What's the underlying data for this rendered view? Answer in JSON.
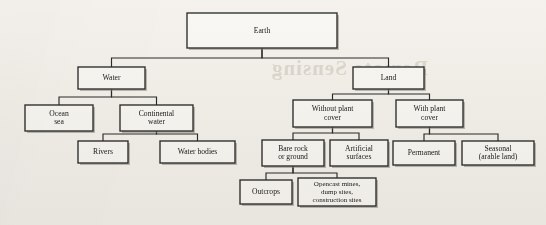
{
  "figure": {
    "background_color": "#f6f4f0",
    "line_color": "#2b2b2b",
    "box_fill": "#fbfaf7",
    "bleed_through_text": "Remote Sensing"
  },
  "chart_data": {
    "type": "diagram",
    "subtype": "tree",
    "orientation": "top-down",
    "title": "Earth",
    "nodes": [
      {
        "id": "earth",
        "label": "Earth",
        "lines": [
          "Earth"
        ],
        "parent": null,
        "x": 187,
        "y": 13,
        "w": 150,
        "h": 35,
        "level": 0
      },
      {
        "id": "water",
        "label": "Water",
        "lines": [
          "Water"
        ],
        "parent": "earth",
        "x": 78,
        "y": 67,
        "w": 67,
        "h": 22,
        "level": 1
      },
      {
        "id": "land",
        "label": "Land",
        "lines": [
          "Land"
        ],
        "parent": "earth",
        "x": 353,
        "y": 67,
        "w": 71,
        "h": 22,
        "level": 1
      },
      {
        "id": "ocean_sea",
        "label": "Ocean sea",
        "lines": [
          "Ocean",
          "sea"
        ],
        "parent": "water",
        "x": 25,
        "y": 105,
        "w": 68,
        "h": 26,
        "level": 2
      },
      {
        "id": "cont_water",
        "label": "Continental water",
        "lines": [
          "Continental",
          "water"
        ],
        "parent": "water",
        "x": 120,
        "y": 105,
        "w": 73,
        "h": 26,
        "level": 2
      },
      {
        "id": "rivers",
        "label": "Rivers",
        "lines": [
          "Rivers"
        ],
        "parent": "cont_water",
        "x": 78,
        "y": 141,
        "w": 50,
        "h": 22,
        "level": 3
      },
      {
        "id": "water_bodies",
        "label": "Water bodies",
        "lines": [
          "Water bodies"
        ],
        "parent": "cont_water",
        "x": 160,
        "y": 141,
        "w": 75,
        "h": 22,
        "level": 3
      },
      {
        "id": "without_plant",
        "label": "Without plant cover",
        "lines": [
          "Without plant",
          "cover"
        ],
        "parent": "land",
        "x": 293,
        "y": 100,
        "w": 79,
        "h": 27,
        "level": 2
      },
      {
        "id": "with_plant",
        "label": "With plant cover",
        "lines": [
          "With plant",
          "cover"
        ],
        "parent": "land",
        "x": 396,
        "y": 100,
        "w": 67,
        "h": 27,
        "level": 2
      },
      {
        "id": "bare_rock",
        "label": "Bare rock or ground",
        "lines": [
          "Bare rock",
          "or ground"
        ],
        "parent": "without_plant",
        "x": 262,
        "y": 140,
        "w": 62,
        "h": 26,
        "level": 3
      },
      {
        "id": "artificial",
        "label": "Artificial surfaces",
        "lines": [
          "Artificial",
          "surfaces"
        ],
        "parent": "without_plant",
        "x": 330,
        "y": 140,
        "w": 58,
        "h": 26,
        "level": 3
      },
      {
        "id": "permanent",
        "label": "Permanent",
        "lines": [
          "Permanent"
        ],
        "parent": "with_plant",
        "x": 393,
        "y": 141,
        "w": 62,
        "h": 24,
        "level": 3
      },
      {
        "id": "seasonal",
        "label": "Seasonal (arable land)",
        "lines": [
          "Seasonal",
          "(arable land)"
        ],
        "parent": "with_plant",
        "x": 462,
        "y": 141,
        "w": 72,
        "h": 24,
        "level": 3
      },
      {
        "id": "outcrops",
        "label": "Outcrops",
        "lines": [
          "Outcrops"
        ],
        "parent": "bare_rock",
        "x": 240,
        "y": 180,
        "w": 52,
        "h": 24,
        "level": 4
      },
      {
        "id": "opencast",
        "label": "Opencast mines, dump sites, construction sites",
        "lines": [
          "Opencast mines,",
          "dump sites,",
          "construction sites"
        ],
        "parent": "bare_rock",
        "x": 298,
        "y": 178,
        "w": 78,
        "h": 28,
        "level": 4
      }
    ],
    "edges": [
      {
        "from": "earth",
        "to": "water",
        "bus_y": 58
      },
      {
        "from": "earth",
        "to": "land",
        "bus_y": 58
      },
      {
        "from": "water",
        "to": "ocean_sea",
        "bus_y": 97
      },
      {
        "from": "water",
        "to": "cont_water",
        "bus_y": 97
      },
      {
        "from": "cont_water",
        "to": "rivers",
        "bus_y": 134
      },
      {
        "from": "cont_water",
        "to": "water_bodies",
        "bus_y": 134
      },
      {
        "from": "land",
        "to": "without_plant",
        "bus_y": 94
      },
      {
        "from": "land",
        "to": "with_plant",
        "bus_y": 94
      },
      {
        "from": "without_plant",
        "to": "bare_rock",
        "bus_y": 133
      },
      {
        "from": "without_plant",
        "to": "artificial",
        "bus_y": 133
      },
      {
        "from": "with_plant",
        "to": "permanent",
        "bus_y": 134
      },
      {
        "from": "with_plant",
        "to": "seasonal",
        "bus_y": 134
      },
      {
        "from": "bare_rock",
        "to": "outcrops",
        "bus_y": 173
      },
      {
        "from": "bare_rock",
        "to": "opencast",
        "bus_y": 173
      }
    ]
  }
}
